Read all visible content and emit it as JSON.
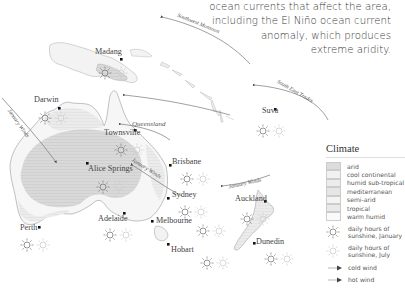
{
  "intro_text": {
    "lines": [
      "ocean currents that affect the area,",
      "including the El Niño ocean current",
      "anomaly, which produces",
      "extreme aridity."
    ]
  },
  "cities": [
    {
      "name": "Madang",
      "x": 97,
      "y": 24
    },
    {
      "name": "Darwin",
      "x": 36,
      "y": 100
    },
    {
      "name": "Townsville",
      "x": 104,
      "y": 128
    },
    {
      "name": "Alice Springs",
      "x": 88,
      "y": 164
    },
    {
      "name": "Brisbane",
      "x": 172,
      "y": 157
    },
    {
      "name": "Sydney",
      "x": 172,
      "y": 190
    },
    {
      "name": "Adelaide",
      "x": 98,
      "y": 214
    },
    {
      "name": "Melbourne",
      "x": 156,
      "y": 216
    },
    {
      "name": "Hobart",
      "x": 170,
      "y": 243
    },
    {
      "name": "Perth",
      "x": 20,
      "y": 223
    },
    {
      "name": "Suva",
      "x": 262,
      "y": 108
    },
    {
      "name": "Auckland",
      "x": 235,
      "y": 196
    },
    {
      "name": "Dunedin",
      "x": 256,
      "y": 239
    }
  ],
  "winds": [
    {
      "label": "Southwest Monsoon",
      "x": 176,
      "y": 20,
      "rotate": 22
    },
    {
      "label": "South East Trades",
      "x": 275,
      "y": 88,
      "rotate": 30
    },
    {
      "label": "Queensland",
      "x": 132,
      "y": 122,
      "rotate": 0
    },
    {
      "label": "January Winds",
      "x": 133,
      "y": 168,
      "rotate": 32
    },
    {
      "label": "January Winds",
      "x": 228,
      "y": 181,
      "rotate": -12
    },
    {
      "label": "January Winds",
      "x": 10,
      "y": 116,
      "rotate": 55
    }
  ],
  "legend": {
    "title": "Climate",
    "climate_types": [
      {
        "label": "arid",
        "color": "#dcdcdc"
      },
      {
        "label": "cool continental",
        "color": "#f1f1f1"
      },
      {
        "label": "humid sub-tropical",
        "color": "#ececec"
      },
      {
        "label": "mediterranean",
        "color": "#e6e6e6"
      },
      {
        "label": "semi-arid",
        "color": "#f4f4f4"
      },
      {
        "label": "tropical",
        "color": "#e9e9e9"
      },
      {
        "label": "warm humid",
        "color": "#fafafa"
      }
    ],
    "sunshine_january": "daily hours of sunshine, January",
    "sunshine_january_l1": "daily hours of",
    "sunshine_january_l2": "sunshine, January",
    "sunshine_july_l1": "daily hours of",
    "sunshine_july_l2": "sunshine, July",
    "cold_wind": "cold wind",
    "hot_wind": "hot wind"
  }
}
